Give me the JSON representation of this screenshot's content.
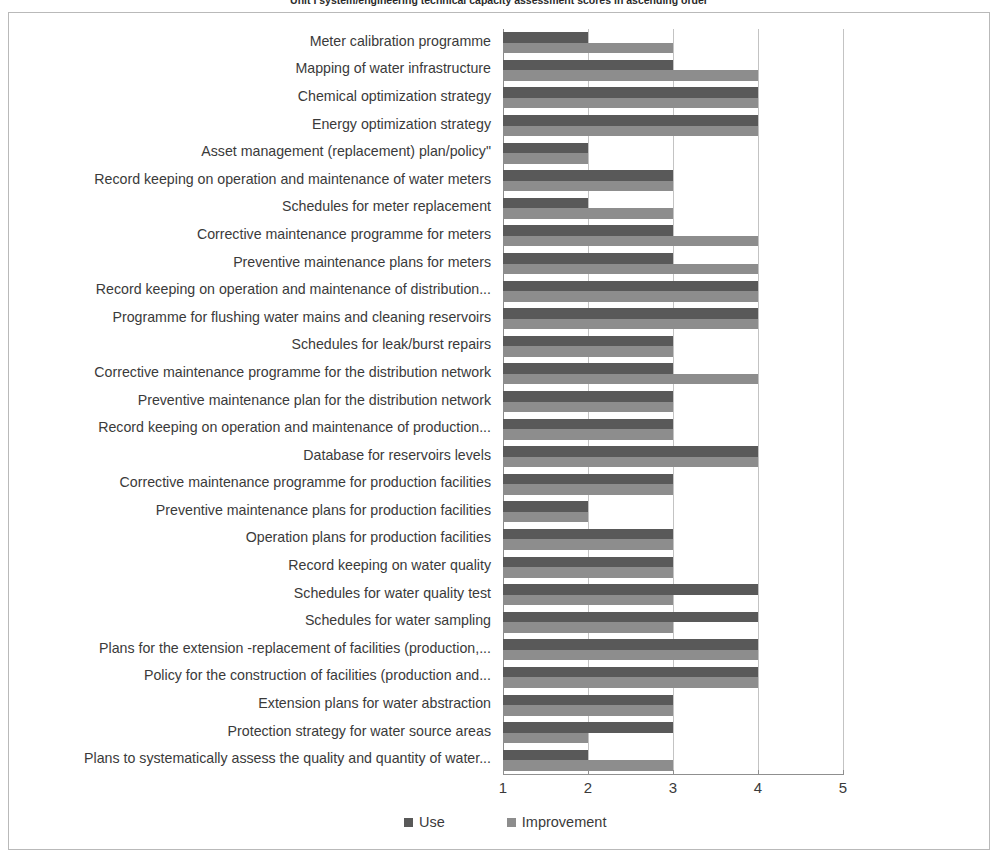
{
  "chart_data": {
    "type": "bar",
    "orientation": "horizontal",
    "title": "Unit I system/engineering technical capacity assessment scores in ascending order",
    "xlabel": "",
    "ylabel": "",
    "xlim": [
      1,
      5
    ],
    "xticks": [
      "1",
      "2",
      "3",
      "4",
      "5"
    ],
    "grid": true,
    "legend_position": "bottom",
    "legend": [
      "Use",
      "Improvement"
    ],
    "colors": {
      "use": "#595959",
      "improvement": "#8d8d8d",
      "gridline": "#c3c3c3",
      "axis": "#8f8f8f",
      "text": "#3a3a3a"
    },
    "categories": [
      "Meter calibration programme",
      "Mapping of water infrastructure",
      "Chemical optimization strategy",
      "Energy optimization strategy",
      "Asset management (replacement) plan/policy\"",
      "Record keeping on operation and maintenance of water meters",
      "Schedules for meter replacement",
      "Corrective maintenance programme for meters",
      "Preventive maintenance plans for meters",
      "Record keeping on operation and maintenance of distribution...",
      "Programme for flushing water mains and cleaning reservoirs",
      "Schedules for leak/burst repairs",
      "Corrective maintenance programme for the distribution network",
      "Preventive  maintenance plan for the distribution network",
      "Record keeping on operation and maintenance of production...",
      "Database for reservoirs levels",
      "Corrective maintenance programme for  production facilities",
      "Preventive maintenance plans for production facilities",
      "Operation plans for production facilities",
      "Record keeping on water quality",
      "Schedules for water quality test",
      "Schedules for water sampling",
      "Plans for the extension -replacement of facilities (production,...",
      "Policy for the construction of facilities (production and...",
      "Extension plans for water abstraction",
      "Protection strategy for water source areas",
      "Plans to systematically assess the  quality and quantity of water..."
    ],
    "series": [
      {
        "name": "Use",
        "values": [
          2,
          3,
          4,
          4,
          2,
          3,
          2,
          3,
          3,
          4,
          4,
          3,
          3,
          3,
          3,
          4,
          3,
          2,
          3,
          3,
          4,
          4,
          4,
          4,
          3,
          3,
          2
        ]
      },
      {
        "name": "Improvement",
        "values": [
          3,
          4,
          4,
          4,
          2,
          3,
          3,
          4,
          4,
          4,
          4,
          3,
          4,
          3,
          3,
          4,
          3,
          2,
          3,
          3,
          3,
          3,
          4,
          4,
          3,
          2,
          3
        ]
      }
    ]
  }
}
